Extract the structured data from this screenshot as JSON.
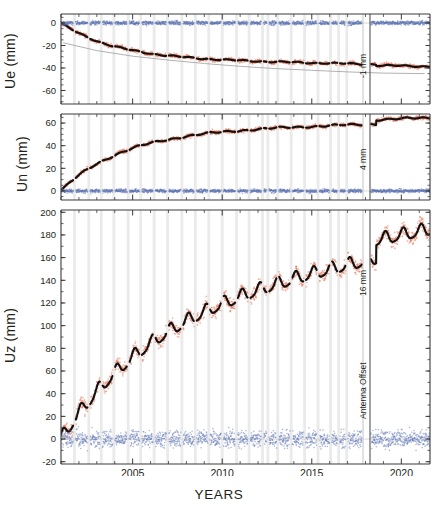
{
  "figure": {
    "xlabel": "YEARS",
    "panels": [
      "Ue (mm)",
      "Un (mm)",
      "Uz (mm)"
    ]
  },
  "axis": {
    "ue_label": "Ue (mm)",
    "un_label": "Un (mm)",
    "uz_label": "Uz (mm)"
  },
  "annotations": {
    "ue_offset": "-1 mm",
    "un_offset": "4 mm",
    "uz_offset": "16 mm",
    "antenna_offset": "Antenna Offset"
  },
  "chart_data": [
    {
      "type": "scatter",
      "title": "",
      "xlabel": "YEARS",
      "ylabel": "Ue (mm)",
      "xlim": [
        2001.0,
        2021.6
      ],
      "ylim": [
        -72,
        8
      ],
      "yticks": [
        0,
        -20,
        -40,
        -60
      ],
      "xticks": [
        2005,
        2010,
        2015,
        2020
      ],
      "grid": false,
      "legend": "none",
      "series": [
        {
          "name": "East displacement (observed)",
          "color": "#e8775a",
          "style": "scatter",
          "x": [
            2001.1,
            2001.5,
            2001.9,
            2002.3,
            2002.7,
            2003.1,
            2003.5,
            2003.9,
            2004.3,
            2004.7,
            2005.1,
            2005.5,
            2005.9,
            2006.3,
            2006.7,
            2007.1,
            2007.5,
            2007.9,
            2008.3,
            2008.7,
            2009.1,
            2009.5,
            2009.9,
            2010.3,
            2010.7,
            2011.1,
            2011.5,
            2011.9,
            2012.3,
            2012.7,
            2013.1,
            2013.5,
            2013.9,
            2014.3,
            2014.7,
            2015.1,
            2015.5,
            2015.9,
            2016.3,
            2016.7,
            2017.1,
            2017.5,
            2018.9,
            2019.4,
            2019.9,
            2020.4,
            2020.9,
            2021.3
          ],
          "y": [
            -0.5,
            -3.2,
            -6.0,
            -8.5,
            -10.2,
            -11.5,
            -13.0,
            -14.5,
            -15.5,
            -16.2,
            -17.5,
            -18.6,
            -19.4,
            -20.0,
            -20.6,
            -21.2,
            -21.6,
            -22.0,
            -22.4,
            -22.8,
            -23.0,
            -23.4,
            -23.8,
            -24.2,
            -24.6,
            -25.0,
            -25.3,
            -25.6,
            -25.9,
            -26.2,
            -26.6,
            -27.0,
            -27.3,
            -27.6,
            -27.9,
            -28.2,
            -28.5,
            -28.8,
            -29.0,
            -29.2,
            -29.4,
            -29.6,
            -30.0,
            -30.2,
            -30.4,
            -30.5,
            -30.6,
            -30.7
          ]
        },
        {
          "name": "East model fit",
          "color": "#111111",
          "style": "line"
        },
        {
          "name": "East residual",
          "color": "#5b74b5",
          "style": "scatter",
          "mean": 0.0,
          "scatter_mm": 2.5
        },
        {
          "name": "Reference / predicted curve",
          "color": "#a8a8a8",
          "style": "line",
          "x": [
            2001.1,
            2003.0,
            2005.0,
            2007.0,
            2009.0,
            2011.0,
            2013.0,
            2015.0,
            2017.0,
            2019.0,
            2021.3
          ],
          "y": [
            -17.5,
            -24.5,
            -29.5,
            -33.0,
            -36.0,
            -38.5,
            -40.5,
            -42.0,
            -43.5,
            -44.5,
            -45.0
          ]
        }
      ]
    },
    {
      "type": "scatter",
      "title": "",
      "xlabel": "YEARS",
      "ylabel": "Un (mm)",
      "xlim": [
        2001.0,
        2021.6
      ],
      "ylim": [
        -8,
        68
      ],
      "yticks": [
        60,
        40,
        20,
        0
      ],
      "xticks": [
        2005,
        2010,
        2015,
        2020
      ],
      "grid": false,
      "legend": "none",
      "series": [
        {
          "name": "North displacement (observed)",
          "color": "#e8775a",
          "style": "scatter",
          "x": [
            2001.1,
            2001.5,
            2001.9,
            2002.3,
            2002.7,
            2003.1,
            2003.5,
            2003.9,
            2004.3,
            2004.7,
            2005.1,
            2005.5,
            2005.9,
            2006.3,
            2006.7,
            2007.1,
            2007.5,
            2007.9,
            2008.3,
            2008.7,
            2009.1,
            2009.5,
            2009.9,
            2010.3,
            2010.7,
            2011.1,
            2011.5,
            2011.9,
            2012.3,
            2012.7,
            2013.1,
            2013.5,
            2013.9,
            2014.3,
            2014.7,
            2015.1,
            2015.5,
            2015.9,
            2016.3,
            2016.7,
            2017.1,
            2017.5,
            2018.9,
            2019.4,
            2019.9,
            2020.4,
            2020.9,
            2021.3
          ],
          "y": [
            0.5,
            4.0,
            8.0,
            12.0,
            15.5,
            18.5,
            21.5,
            24.0,
            26.5,
            28.5,
            31.0,
            33.0,
            35.0,
            36.5,
            38.0,
            39.5,
            41.0,
            42.0,
            43.0,
            44.0,
            45.0,
            46.0,
            47.0,
            48.0,
            48.8,
            49.6,
            50.4,
            51.0,
            51.6,
            52.2,
            52.8,
            53.4,
            54.0,
            54.5,
            55.0,
            55.4,
            55.8,
            56.2,
            56.6,
            56.9,
            57.2,
            57.5,
            58.0,
            58.2,
            58.4,
            58.6,
            58.7,
            58.8
          ]
        },
        {
          "name": "North model fit",
          "color": "#111111",
          "style": "line"
        },
        {
          "name": "North residual",
          "color": "#5b74b5",
          "style": "scatter",
          "mean": 0.0,
          "scatter_mm": 2.2
        }
      ]
    },
    {
      "type": "scatter",
      "title": "",
      "xlabel": "YEARS",
      "ylabel": "Uz (mm)",
      "xlim": [
        2001.0,
        2021.6
      ],
      "ylim": [
        -22,
        202
      ],
      "yticks": [
        200,
        180,
        160,
        140,
        120,
        100,
        80,
        60,
        40,
        20,
        0,
        -20
      ],
      "xticks": [
        2005,
        2010,
        2015,
        2020
      ],
      "grid": false,
      "legend": "none",
      "series": [
        {
          "name": "Vertical displacement (observed)",
          "color": "#e8775a",
          "style": "scatter",
          "seasonal_amplitude_mm": 6,
          "x": [
            2001.1,
            2001.6,
            2002.1,
            2002.6,
            2003.1,
            2003.6,
            2004.1,
            2004.6,
            2005.1,
            2005.6,
            2006.1,
            2006.6,
            2007.1,
            2007.6,
            2008.1,
            2008.6,
            2009.1,
            2009.6,
            2010.1,
            2010.6,
            2011.1,
            2011.6,
            2012.1,
            2012.6,
            2013.1,
            2013.6,
            2014.1,
            2014.6,
            2015.1,
            2015.6,
            2016.1,
            2016.6,
            2017.1,
            2017.5,
            2018.9,
            2019.4,
            2019.9,
            2020.4,
            2020.9,
            2021.3
          ],
          "y": [
            0,
            8,
            18,
            26,
            34,
            42,
            50,
            56,
            62,
            68,
            74,
            80,
            84,
            88,
            92,
            96,
            100,
            104,
            106,
            110,
            113,
            116,
            118,
            121,
            124,
            126,
            128,
            130,
            132,
            134,
            135,
            137,
            138,
            140,
            148,
            152,
            155,
            157,
            159,
            160
          ]
        },
        {
          "name": "Vertical model fit",
          "color": "#111111",
          "style": "line"
        },
        {
          "name": "Vertical residual",
          "color": "#5b74b5",
          "style": "scatter",
          "mean": 0.0,
          "scatter_mm": 9
        }
      ]
    }
  ]
}
